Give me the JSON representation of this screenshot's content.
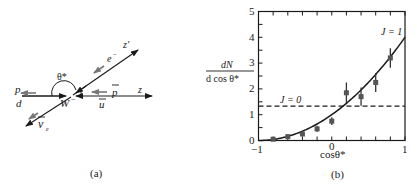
{
  "panel_a": {
    "caption": "(a)",
    "labels": {
      "p": "p",
      "d": "d",
      "W": "W",
      "W_charge": "−",
      "pbar": "p",
      "ubar": "u",
      "z": "z",
      "zprime": "z'",
      "electron": "e",
      "electron_charge": "−",
      "nubar": "ν",
      "nubar_sub": "e",
      "theta": "θ*"
    }
  },
  "panel_b": {
    "caption": "(b)",
    "ylabel_num": "dN",
    "ylabel_den": "d cos θ*",
    "xlabel": "cosθ*",
    "curve_J1_label": "J = 1",
    "line_J0_label": "J = 0",
    "xticks": [
      "−1",
      "0",
      "1"
    ],
    "yticks": [
      "0",
      "1",
      "2",
      "3",
      "4",
      "5"
    ]
  },
  "chart_data": {
    "type": "scatter",
    "title": "",
    "xlabel": "cosθ*",
    "ylabel": "dN / d cosθ*",
    "xlim": [
      -1,
      1
    ],
    "ylim": [
      0,
      5
    ],
    "grid": false,
    "legend_position": "inline annotations",
    "x_tick_labels": [
      "-1",
      "0",
      "1"
    ],
    "y_tick_labels": [
      "0",
      "1",
      "2",
      "3",
      "4",
      "5"
    ],
    "series": [
      {
        "name": "data",
        "kind": "points_with_error_bars",
        "x": [
          -0.8,
          -0.6,
          -0.4,
          -0.2,
          0.0,
          0.2,
          0.4,
          0.6,
          0.8
        ],
        "y": [
          0.05,
          0.15,
          0.25,
          0.45,
          0.75,
          1.85,
          1.7,
          2.25,
          3.2
        ],
        "yerr": [
          0.05,
          0.05,
          0.07,
          0.12,
          0.15,
          0.4,
          0.35,
          0.37,
          0.38
        ]
      },
      {
        "name": "J = 1",
        "kind": "line",
        "style": "solid",
        "formula": "(1 + cosθ*)^2",
        "x": [
          -1,
          -0.5,
          0,
          0.5,
          1
        ],
        "y": [
          0,
          0.25,
          1,
          2.25,
          4
        ]
      },
      {
        "name": "J = 0",
        "kind": "line",
        "style": "dashed",
        "x": [
          -1,
          1
        ],
        "y": [
          1.33,
          1.33
        ]
      }
    ]
  }
}
